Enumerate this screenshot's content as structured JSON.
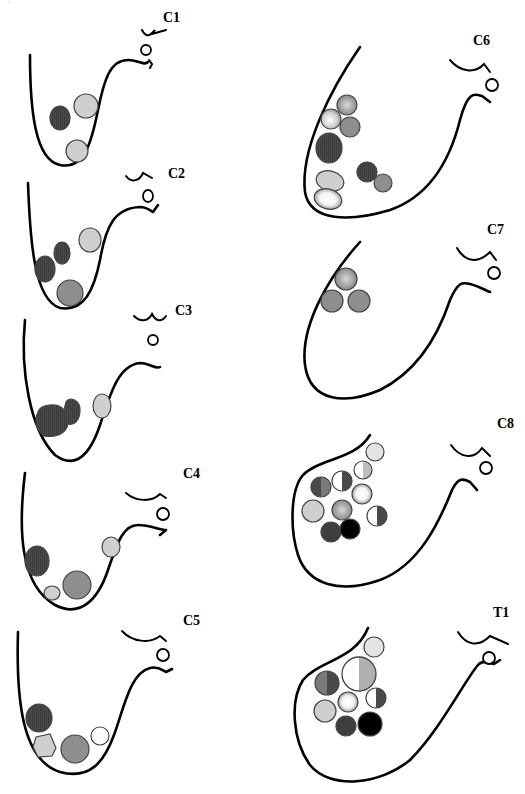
{
  "figure": {
    "title": "",
    "colors": {
      "dark": "#4a4a4a",
      "medium": "#8e8e8e",
      "light": "#cfcfcf",
      "white": "#ffffff",
      "black": "#000000",
      "outline": "#000000"
    },
    "panels": [
      {
        "id": "C1",
        "label": "C1",
        "column": "left",
        "row": 1,
        "cells": [
          "dark-oval",
          "light-circle",
          "light-circle"
        ]
      },
      {
        "id": "C2",
        "label": "C2",
        "column": "left",
        "row": 2,
        "cells": [
          "dark-oval",
          "dark-oval",
          "light-circle",
          "medium-circle"
        ]
      },
      {
        "id": "C3",
        "label": "C3",
        "column": "left",
        "row": 3,
        "cells": [
          "dark-large-blob",
          "dark-oval",
          "light-oval"
        ]
      },
      {
        "id": "C4",
        "label": "C4",
        "column": "left",
        "row": 4,
        "cells": [
          "dark-oval",
          "light-small",
          "medium-circle",
          "light-circle"
        ]
      },
      {
        "id": "C5",
        "label": "C5",
        "column": "left",
        "row": 5,
        "cells": [
          "dark-circle",
          "light-polygon",
          "medium-circle",
          "white-circle"
        ]
      },
      {
        "id": "C6",
        "label": "C6",
        "column": "right",
        "row": 1,
        "cells": [
          "gradient-circle",
          "gradient-circle",
          "medium-circle",
          "dark-oval",
          "light-ellipse",
          "gradient-ellipse",
          "dark-circle",
          "medium-circle"
        ]
      },
      {
        "id": "C7",
        "label": "C7",
        "column": "right",
        "row": 2,
        "cells": [
          "gradient-circle",
          "medium-circle",
          "medium-circle"
        ]
      },
      {
        "id": "C8",
        "label": "C8",
        "column": "right",
        "row": 3,
        "cells": [
          "light-circle",
          "half-white-light",
          "half-dark-medium",
          "half-white-dark",
          "gradient-circle",
          "light-circle",
          "gradient-medium",
          "half-white-dark",
          "dark-circle",
          "black-circle"
        ]
      },
      {
        "id": "T1",
        "label": "T1",
        "column": "right",
        "row": 4,
        "cells": [
          "light-circle",
          "half-white-light-large",
          "half-medium-dark",
          "gradient-circle",
          "half-white-dark",
          "light-circle",
          "dark-circle",
          "black-circle"
        ]
      }
    ]
  }
}
